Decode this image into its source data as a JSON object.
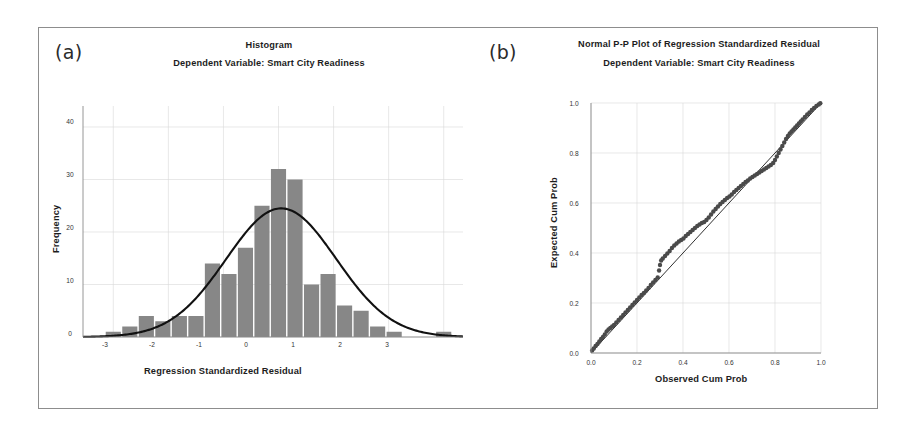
{
  "figure": {
    "panel_a_tag": "(a)",
    "panel_b_tag": "(b)"
  },
  "chart_data": [
    {
      "type": "bar",
      "panel": "(a)",
      "title": "Histogram",
      "subtitle": "Dependent Variable: Smart City Readiness",
      "xlabel": "Regression Standardized Residual",
      "ylabel": "Frequency",
      "xlim": [
        -3.55,
        3.35
      ],
      "ylim": [
        0,
        44
      ],
      "xticks": [
        -3,
        -2,
        -1,
        0,
        1,
        2,
        3
      ],
      "xtick_labels": [
        "-3",
        "-2",
        "-1",
        "0",
        "1",
        "2",
        "3"
      ],
      "yticks": [
        0,
        10,
        20,
        30,
        40
      ],
      "ytick_labels": [
        "0",
        "10",
        "20",
        "30",
        "40"
      ],
      "grid": true,
      "bar_color": "#878787",
      "curve_color": "#111111",
      "bin_width": 0.3,
      "bin_left_edges": [
        -3.15,
        -2.85,
        -2.55,
        -2.25,
        -1.95,
        -1.65,
        -1.35,
        -1.05,
        -0.75,
        -0.45,
        -0.15,
        0.15,
        0.45,
        0.75,
        1.05,
        1.35,
        1.65,
        1.95,
        2.25,
        2.85
      ],
      "values": [
        1,
        2,
        4,
        3,
        4,
        4,
        14,
        12,
        17,
        25,
        32,
        30,
        10,
        12,
        6,
        5,
        2,
        1,
        0,
        1
      ],
      "normal_curve": {
        "mean": 0.05,
        "sd": 1.0,
        "peak_frequency": 24.5,
        "description": "Normal distribution overlay curve"
      },
      "annotations": []
    },
    {
      "type": "scatter",
      "panel": "(b)",
      "title": "Normal P-P Plot of Regression Standardized Residual",
      "subtitle": "Dependent Variable: Smart City Readiness",
      "xlabel": "Observed Cum Prob",
      "ylabel": "Expected Cum Prob",
      "xlim": [
        0.0,
        1.0
      ],
      "ylim": [
        0.0,
        1.0
      ],
      "xticks": [
        0.0,
        0.2,
        0.4,
        0.6,
        0.8,
        1.0
      ],
      "xtick_labels": [
        "0.0",
        "0.2",
        "0.4",
        "0.6",
        "0.8",
        "1.0"
      ],
      "yticks": [
        0.0,
        0.2,
        0.4,
        0.6,
        0.8,
        1.0
      ],
      "ytick_labels": [
        "0.0",
        "0.2",
        "0.4",
        "0.6",
        "0.8",
        "1.0"
      ],
      "grid": true,
      "point_color": "#4a4a4a",
      "reference_line_color": "#1a1a1a",
      "reference_line": {
        "from": [
          0.0,
          0.0
        ],
        "to": [
          1.0,
          1.0
        ]
      },
      "points": [
        [
          0.005,
          0.01
        ],
        [
          0.012,
          0.018
        ],
        [
          0.02,
          0.028
        ],
        [
          0.028,
          0.036
        ],
        [
          0.036,
          0.046
        ],
        [
          0.044,
          0.056
        ],
        [
          0.052,
          0.064
        ],
        [
          0.06,
          0.074
        ],
        [
          0.068,
          0.086
        ],
        [
          0.076,
          0.094
        ],
        [
          0.084,
          0.1
        ],
        [
          0.092,
          0.106
        ],
        [
          0.1,
          0.112
        ],
        [
          0.11,
          0.122
        ],
        [
          0.12,
          0.132
        ],
        [
          0.13,
          0.142
        ],
        [
          0.14,
          0.152
        ],
        [
          0.15,
          0.162
        ],
        [
          0.16,
          0.172
        ],
        [
          0.17,
          0.182
        ],
        [
          0.18,
          0.192
        ],
        [
          0.19,
          0.202
        ],
        [
          0.2,
          0.212
        ],
        [
          0.21,
          0.222
        ],
        [
          0.22,
          0.232
        ],
        [
          0.23,
          0.24
        ],
        [
          0.24,
          0.25
        ],
        [
          0.25,
          0.26
        ],
        [
          0.26,
          0.272
        ],
        [
          0.27,
          0.282
        ],
        [
          0.28,
          0.292
        ],
        [
          0.29,
          0.302
        ],
        [
          0.296,
          0.33
        ],
        [
          0.3,
          0.352
        ],
        [
          0.305,
          0.37
        ],
        [
          0.312,
          0.378
        ],
        [
          0.322,
          0.388
        ],
        [
          0.332,
          0.398
        ],
        [
          0.342,
          0.408
        ],
        [
          0.352,
          0.42
        ],
        [
          0.362,
          0.43
        ],
        [
          0.372,
          0.438
        ],
        [
          0.382,
          0.446
        ],
        [
          0.392,
          0.452
        ],
        [
          0.402,
          0.458
        ],
        [
          0.412,
          0.468
        ],
        [
          0.422,
          0.476
        ],
        [
          0.432,
          0.484
        ],
        [
          0.442,
          0.492
        ],
        [
          0.452,
          0.5
        ],
        [
          0.462,
          0.508
        ],
        [
          0.472,
          0.514
        ],
        [
          0.482,
          0.52
        ],
        [
          0.492,
          0.524
        ],
        [
          0.502,
          0.532
        ],
        [
          0.512,
          0.542
        ],
        [
          0.522,
          0.554
        ],
        [
          0.532,
          0.566
        ],
        [
          0.542,
          0.576
        ],
        [
          0.552,
          0.586
        ],
        [
          0.562,
          0.596
        ],
        [
          0.572,
          0.604
        ],
        [
          0.582,
          0.612
        ],
        [
          0.592,
          0.62
        ],
        [
          0.602,
          0.626
        ],
        [
          0.612,
          0.634
        ],
        [
          0.622,
          0.644
        ],
        [
          0.632,
          0.652
        ],
        [
          0.642,
          0.66
        ],
        [
          0.652,
          0.668
        ],
        [
          0.662,
          0.676
        ],
        [
          0.672,
          0.684
        ],
        [
          0.682,
          0.69
        ],
        [
          0.692,
          0.698
        ],
        [
          0.702,
          0.704
        ],
        [
          0.712,
          0.71
        ],
        [
          0.722,
          0.716
        ],
        [
          0.732,
          0.722
        ],
        [
          0.742,
          0.728
        ],
        [
          0.752,
          0.734
        ],
        [
          0.762,
          0.74
        ],
        [
          0.772,
          0.746
        ],
        [
          0.782,
          0.752
        ],
        [
          0.792,
          0.76
        ],
        [
          0.8,
          0.772
        ],
        [
          0.808,
          0.786
        ],
        [
          0.816,
          0.8
        ],
        [
          0.824,
          0.814
        ],
        [
          0.832,
          0.828
        ],
        [
          0.84,
          0.842
        ],
        [
          0.848,
          0.856
        ],
        [
          0.856,
          0.868
        ],
        [
          0.864,
          0.878
        ],
        [
          0.872,
          0.886
        ],
        [
          0.88,
          0.894
        ],
        [
          0.888,
          0.902
        ],
        [
          0.896,
          0.91
        ],
        [
          0.904,
          0.918
        ],
        [
          0.912,
          0.926
        ],
        [
          0.92,
          0.934
        ],
        [
          0.93,
          0.944
        ],
        [
          0.94,
          0.954
        ],
        [
          0.95,
          0.962
        ],
        [
          0.96,
          0.972
        ],
        [
          0.97,
          0.98
        ],
        [
          0.98,
          0.988
        ],
        [
          0.99,
          0.994
        ],
        [
          0.997,
          0.999
        ]
      ]
    }
  ]
}
